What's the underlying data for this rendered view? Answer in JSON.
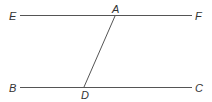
{
  "diagram": {
    "type": "geometry",
    "points": {
      "E": {
        "label": "E",
        "x": 20,
        "y": 15
      },
      "A": {
        "label": "A",
        "x": 115,
        "y": 15
      },
      "F": {
        "label": "F",
        "x": 192,
        "y": 15
      },
      "B": {
        "label": "B",
        "x": 20,
        "y": 87
      },
      "D": {
        "label": "D",
        "x": 84,
        "y": 87
      },
      "C": {
        "label": "C",
        "x": 192,
        "y": 87
      }
    },
    "segments": [
      {
        "name": "EF",
        "from": "E",
        "to": "F"
      },
      {
        "name": "BC",
        "from": "B",
        "to": "C"
      },
      {
        "name": "AD",
        "from": "A",
        "to": "D"
      }
    ],
    "colors": {
      "line": "#555555",
      "text": "#333333",
      "background": "#ffffff"
    }
  }
}
